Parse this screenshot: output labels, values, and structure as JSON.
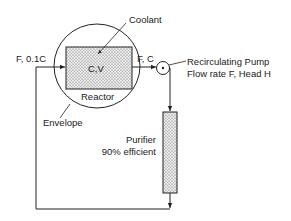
{
  "diagram": {
    "labels": {
      "coolant": "Coolant",
      "cv": "C,V",
      "reactor": "Reactor",
      "envelope": "Envelope",
      "inlet": "F,  0.1C",
      "outlet": "F,  C",
      "pump_line1": "Recirculating Pump",
      "pump_line2": "Flow rate F, Head H",
      "purifier_line1": "Purifier",
      "purifier_line2": "90% efficient"
    },
    "colors": {
      "line": "#222222",
      "stipple": "#d8d8d8",
      "background": "#ffffff"
    }
  }
}
